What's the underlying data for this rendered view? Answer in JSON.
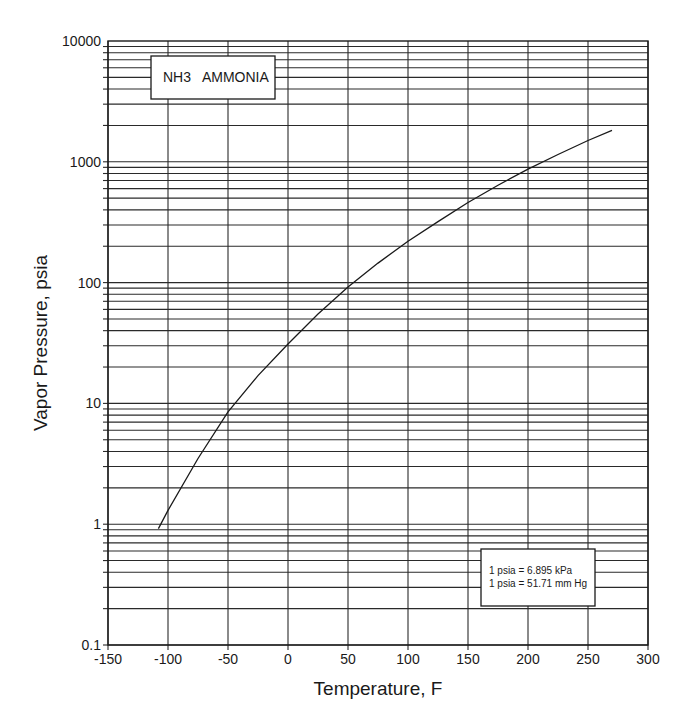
{
  "chart_data": {
    "type": "line",
    "title": "NH3   AMMONIA",
    "xlabel": "Temperature, F",
    "ylabel": "Vapor Pressure, psia",
    "yscale": "log",
    "xlim": [
      -150,
      300
    ],
    "ylim": [
      0.1,
      10000
    ],
    "grid": true,
    "x_ticks": [
      -150,
      -100,
      -50,
      0,
      50,
      100,
      150,
      200,
      250,
      300
    ],
    "x_tick_labels": [
      "-150",
      "-100",
      "-50",
      "0",
      "50",
      "100",
      "150",
      "200",
      "250",
      "300"
    ],
    "y_ticks": [
      0.1,
      1,
      10,
      100,
      1000,
      10000
    ],
    "y_tick_labels": [
      "0.1",
      "1",
      "10",
      "100",
      "1000",
      "10000"
    ],
    "series": [
      {
        "name": "NH3 Ammonia vapor pressure",
        "x": [
          -108,
          -100,
          -75,
          -50,
          -25,
          0,
          25,
          50,
          75,
          100,
          125,
          150,
          175,
          200,
          225,
          250,
          270
        ],
        "y": [
          0.92,
          1.3,
          3.5,
          8.5,
          17,
          31,
          55,
          92,
          145,
          220,
          320,
          460,
          640,
          870,
          1150,
          1500,
          1820
        ]
      }
    ],
    "annotations": [
      "1 psia = 6.895 kPa",
      "1 psia = 51.71 mm Hg"
    ]
  },
  "labels": {
    "title": "NH3   AMMONIA",
    "xlabel": "Temperature, F",
    "ylabel": "Vapor Pressure, psia",
    "note_line1": "1 psia = 6.895 kPa",
    "note_line2": "1 psia = 51.71 mm Hg"
  }
}
